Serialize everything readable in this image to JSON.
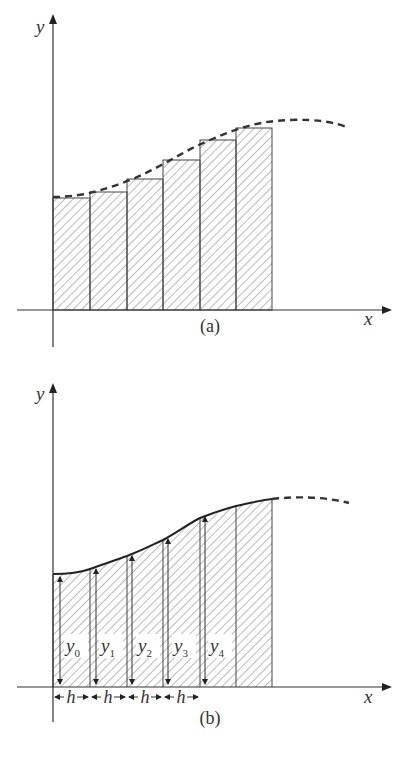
{
  "panel_a": {
    "caption": "(a)",
    "x_label": "x",
    "y_label": "y",
    "description": "Rectangles under a curve (rectangle rule)",
    "curve_style": "dashed",
    "bar_count": 6
  },
  "panel_b": {
    "caption": "(b)",
    "x_label": "x",
    "y_label": "y",
    "description": "Trapezoidal strips under a curve with ordinates",
    "curve_style": "solid-then-dashed",
    "ordinates": [
      {
        "base": "y",
        "sub": "0"
      },
      {
        "base": "y",
        "sub": "1"
      },
      {
        "base": "y",
        "sub": "2"
      },
      {
        "base": "y",
        "sub": "3"
      },
      {
        "base": "y",
        "sub": "4"
      }
    ],
    "width_labels": [
      "h",
      "h",
      "h",
      "h"
    ]
  },
  "colors": {
    "ink": "#333333",
    "background": "#ffffff"
  }
}
